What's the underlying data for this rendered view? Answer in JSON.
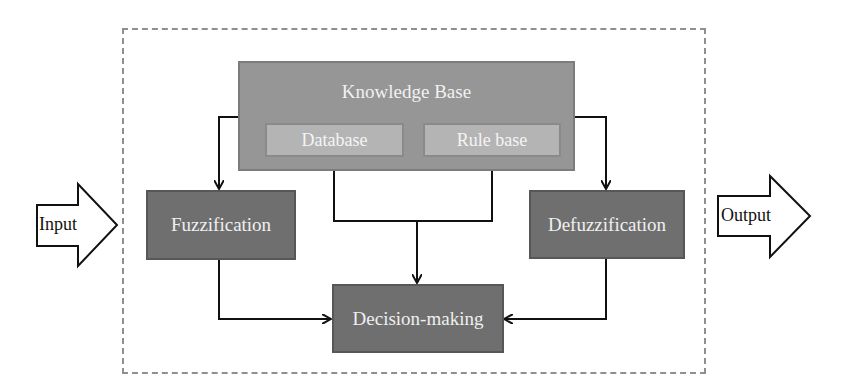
{
  "diagram": {
    "input_label": "Input",
    "output_label": "Output",
    "knowledge_base": {
      "label": "Knowledge Base",
      "database_label": "Database",
      "rule_base_label": "Rule base"
    },
    "fuzzification_label": "Fuzzification",
    "defuzzification_label": "Defuzzification",
    "decision_label": "Decision-making",
    "colors": {
      "dark_box": "#6f6f6f",
      "knowledge_base": "#969696",
      "inner_box": "#b4b4b4",
      "frame": "#8f8f8f",
      "box_text": "#efefef"
    },
    "edges": [
      {
        "from": "Input",
        "to": "Fuzzification"
      },
      {
        "from": "Knowledge Base",
        "to": "Fuzzification"
      },
      {
        "from": "Knowledge Base",
        "to": "Defuzzification"
      },
      {
        "from": "Database",
        "to": "Decision-making"
      },
      {
        "from": "Rule base",
        "to": "Decision-making"
      },
      {
        "from": "Fuzzification",
        "to": "Decision-making"
      },
      {
        "from": "Defuzzification",
        "to": "Decision-making"
      },
      {
        "from": "Defuzzification",
        "to": "Output"
      }
    ]
  }
}
